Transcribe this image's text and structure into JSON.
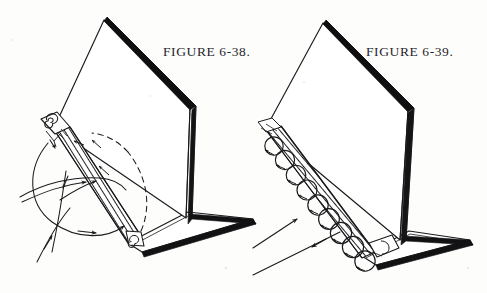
{
  "document": {
    "kind": "technical-line-illustration",
    "medium": "scanned book plate",
    "width": 487,
    "height": 293,
    "background_color": "#fdfdfc",
    "ink_color": "#1a1a1c"
  },
  "figures": [
    {
      "id": "figure-6-38",
      "caption": "FIGURE 6-38.",
      "caption_position": {
        "x": 163,
        "y": 44
      },
      "subject": "tilted panel on a flat base with hatched leading strip and attached curved flow lines",
      "flow_style": "smooth attached streamlines with a dashed separation boundary",
      "has_vortices": false,
      "arrow_count": 7,
      "dashed_curve": true
    },
    {
      "id": "figure-6-39",
      "caption": "FIGURE 6-39.",
      "caption_position": {
        "x": 366,
        "y": 44
      },
      "subject": "tilted panel on a flat base with hatched leading strip and a row of rotating eddies",
      "flow_style": "separated flow forming a chain of circular vortices along the hatched strip",
      "has_vortices": true,
      "vortex_count": 9,
      "arrow_count": 2,
      "dashed_curve": false
    }
  ],
  "colors": {
    "ink": "#1a1a1c",
    "paper": "#fdfdfc",
    "hatch": "#2a2a2c",
    "shadow_edge": "#0d0d0f"
  }
}
